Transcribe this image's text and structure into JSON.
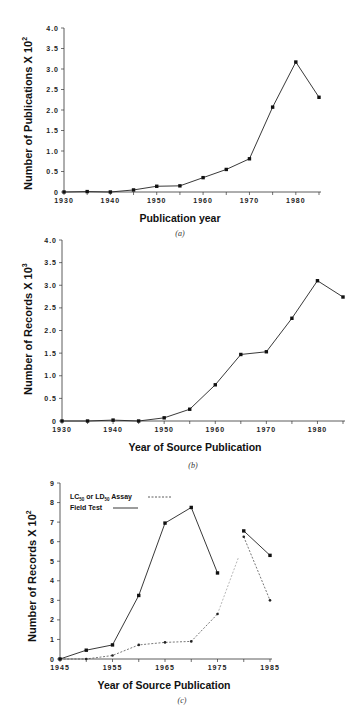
{
  "chart_data": [
    {
      "id": "a",
      "type": "line",
      "caption": "(a)",
      "title": "",
      "xlabel": "Publication year",
      "ylabel": "Number of Publications X 10",
      "ylabel_exponent": "2",
      "x": [
        1930,
        1935,
        1940,
        1945,
        1950,
        1955,
        1960,
        1965,
        1970,
        1975,
        1980,
        1985
      ],
      "series": [
        {
          "name": "Publications",
          "style": "solid",
          "values": [
            0,
            0.01,
            0,
            0.05,
            0.14,
            0.15,
            0.35,
            0.55,
            0.81,
            2.07,
            3.17,
            2.31
          ]
        }
      ],
      "xticks": [
        1930,
        1940,
        1950,
        1960,
        1970,
        1980
      ],
      "yticks": [
        "0",
        "0.5",
        "1.0",
        "1.5",
        "2.0",
        "2.5",
        "3.0",
        "3.5",
        "4.0"
      ],
      "xlim": [
        1930,
        1985
      ],
      "ylim": [
        0,
        4.0
      ],
      "grid": false,
      "legend": null
    },
    {
      "id": "b",
      "type": "line",
      "caption": "(b)",
      "title": "",
      "xlabel": "Year of Source Publication",
      "ylabel": "Number of Records X 10",
      "ylabel_exponent": "3",
      "x": [
        1930,
        1935,
        1940,
        1945,
        1950,
        1955,
        1960,
        1965,
        1970,
        1975,
        1980,
        1985
      ],
      "series": [
        {
          "name": "Records",
          "style": "solid",
          "values": [
            0,
            0,
            0.02,
            0,
            0.07,
            0.26,
            0.8,
            1.47,
            1.53,
            2.27,
            3.1,
            2.74
          ]
        }
      ],
      "xticks": [
        1930,
        1940,
        1950,
        1960,
        1970,
        1980
      ],
      "yticks": [
        "0",
        "0.5",
        "1.0",
        "1.5",
        "2.0",
        "2.5",
        "3.0",
        "3.5",
        "4.0"
      ],
      "xlim": [
        1930,
        1985
      ],
      "ylim": [
        0,
        4.0
      ],
      "grid": false,
      "legend": null
    },
    {
      "id": "c",
      "type": "line",
      "caption": "(c)",
      "title": "",
      "xlabel": "Year of Source Publication",
      "ylabel": "Number of Records X 10",
      "ylabel_exponent": "2",
      "x": [
        1945,
        1950,
        1955,
        1960,
        1965,
        1970,
        1975,
        1980,
        1985
      ],
      "series": [
        {
          "name": "LC50 or LD50 Assay",
          "style": "dashed",
          "values": [
            0,
            0,
            0.18,
            0.72,
            0.85,
            0.9,
            2.3,
            6.25,
            3.0
          ]
        },
        {
          "name": "Field Test",
          "style": "solid",
          "values": [
            0,
            0.45,
            0.72,
            3.25,
            6.95,
            7.75,
            4.4,
            6.55,
            5.3
          ]
        }
      ],
      "xticks": [
        1945,
        1955,
        1965,
        1975,
        1985
      ],
      "yticks": [
        "0",
        "1",
        "2",
        "3",
        "4",
        "5",
        "6",
        "7",
        "8",
        "9"
      ],
      "xlim": [
        1945,
        1985
      ],
      "ylim": [
        0,
        9
      ],
      "grid": false,
      "legend": {
        "position": "upper-left",
        "entries": [
          {
            "label_main": "LC",
            "sub1": "50",
            "mid": " or LD",
            "sub2": "50",
            "tail": " Assay",
            "style": "dashed"
          },
          {
            "label_main": "Field Test",
            "style": "solid"
          }
        ]
      }
    }
  ]
}
